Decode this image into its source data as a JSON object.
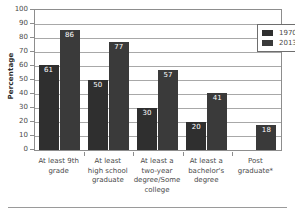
{
  "chart_data": {
    "type": "bar",
    "title": "",
    "xlabel": "",
    "ylabel": "Percentage",
    "ylim": [
      0,
      100
    ],
    "ytick_values": [
      0,
      10,
      20,
      30,
      40,
      50,
      60,
      70,
      80,
      90,
      100
    ],
    "ytick_labels": [
      "0",
      "10",
      "20",
      "30",
      "40",
      "50",
      "60",
      "70",
      "80",
      "90",
      "100"
    ],
    "grid": true,
    "legend_position": "top-right",
    "categories": [
      "At least 9th grade",
      "At least high school graduate",
      "At least a two-year degree/Some college",
      "At least a bachelor's degree",
      "Post graduate*"
    ],
    "category_lines": [
      [
        "At least 9th",
        "grade"
      ],
      [
        "At least",
        "high school",
        "graduate"
      ],
      [
        "At least a",
        "two-year",
        "degree/Some",
        "college"
      ],
      [
        "At least a",
        "bachelor's",
        "degree"
      ],
      [
        "Post",
        "graduate*"
      ]
    ],
    "series": [
      {
        "name": "1970",
        "color": "#2f2f2f",
        "values": [
          61,
          50,
          30,
          20,
          null
        ],
        "labels": [
          "61",
          "50",
          "30",
          "20",
          ""
        ]
      },
      {
        "name": "2013",
        "color": "#3a3a3a",
        "values": [
          86,
          77,
          57,
          41,
          18
        ],
        "labels": [
          "86",
          "77",
          "57",
          "41",
          "18"
        ]
      }
    ]
  },
  "legend": {
    "entries": [
      {
        "label": "1970"
      },
      {
        "label": "2013"
      }
    ]
  }
}
